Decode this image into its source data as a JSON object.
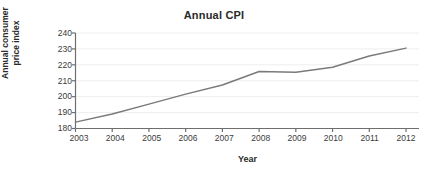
{
  "chart_data": {
    "type": "line",
    "title": "Annual CPI",
    "xlabel": "Year",
    "ylabel": "Annual consumer price index",
    "ylabel_line1": "Annual consumer",
    "ylabel_line2": "price index",
    "categories": [
      "2003",
      "2004",
      "2005",
      "2006",
      "2007",
      "2008",
      "2009",
      "2010",
      "2011",
      "2012"
    ],
    "x": [
      2003,
      2004,
      2005,
      2006,
      2007,
      2008,
      2009,
      2010,
      2011,
      2012
    ],
    "values": [
      184.0,
      189.1,
      195.3,
      201.6,
      207.3,
      215.8,
      215.3,
      218.5,
      225.5,
      230.5
    ],
    "series": [
      {
        "name": "Annual consumer price index",
        "values": [
          184.0,
          189.1,
          195.3,
          201.6,
          207.3,
          215.8,
          215.3,
          218.5,
          225.5,
          230.5
        ],
        "color": "#7a7a7a"
      }
    ],
    "ylim": [
      180,
      240
    ],
    "xlim": [
      2003,
      2012
    ],
    "yticks": [
      180,
      190,
      200,
      210,
      220,
      230,
      240
    ],
    "ytick_labels": [
      "180",
      "190",
      "200",
      "210",
      "220",
      "230",
      "240"
    ],
    "xticks": [
      2003,
      2004,
      2005,
      2006,
      2007,
      2008,
      2009,
      2010,
      2011,
      2012
    ],
    "xtick_labels": [
      "2003",
      "2004",
      "2005",
      "2006",
      "2007",
      "2008",
      "2009",
      "2010",
      "2011",
      "2012"
    ],
    "grid": true,
    "grid_axis": "y",
    "legend": false,
    "legend_position": "none",
    "line_color": "#7a7a7a",
    "grid_color": "#eeeef2",
    "axis_color": "#6e6e6e",
    "background": "#ffffff"
  }
}
